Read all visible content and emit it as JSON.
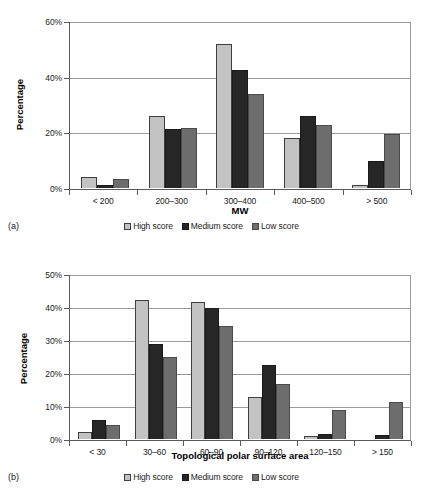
{
  "figure": {
    "panel_a_caption": "(a)",
    "panel_b_caption": "(b)"
  },
  "legend": {
    "items": [
      {
        "label": "High score",
        "color": "#c3c3c3"
      },
      {
        "label": "Medium score",
        "color": "#262626"
      },
      {
        "label": "Low score",
        "color": "#6d6d6d"
      }
    ]
  },
  "chart_data": [
    {
      "type": "bar",
      "panel": "(a)",
      "title": "",
      "xlabel": "MW",
      "ylabel": "Percentage",
      "ylim": [
        0,
        60
      ],
      "yticks": [
        0,
        20,
        40,
        60
      ],
      "ytick_labels": [
        "0%",
        "20%",
        "40%",
        "60%"
      ],
      "grid": true,
      "legend_position": "bottom",
      "categories": [
        "< 200",
        "200–300",
        "300–400",
        "400–500",
        "> 500"
      ],
      "series": [
        {
          "name": "High score",
          "color": "#c3c3c3",
          "values": [
            4.0,
            25.8,
            51.6,
            17.8,
            1.0
          ]
        },
        {
          "name": "Medium score",
          "color": "#262626",
          "values": [
            1.0,
            21.2,
            42.5,
            25.7,
            9.8
          ]
        },
        {
          "name": "Low score",
          "color": "#6d6d6d",
          "values": [
            3.1,
            21.4,
            33.8,
            22.6,
            19.3
          ]
        }
      ]
    },
    {
      "type": "bar",
      "panel": "(b)",
      "title": "",
      "xlabel": "Topological polar surface area",
      "ylabel": "Percentage",
      "ylim": [
        0,
        50
      ],
      "yticks": [
        0,
        10,
        20,
        30,
        40,
        50
      ],
      "ytick_labels": [
        "0%",
        "10%",
        "20%",
        "30%",
        "40%",
        "50%"
      ],
      "grid": true,
      "legend_position": "bottom",
      "categories": [
        "< 30",
        "30–60",
        "60–90",
        "90–120",
        "120–150",
        "> 150"
      ],
      "series": [
        {
          "name": "High score",
          "color": "#c3c3c3",
          "values": [
            2.1,
            42.1,
            41.4,
            12.7,
            0.9,
            0.0
          ]
        },
        {
          "name": "Medium score",
          "color": "#262626",
          "values": [
            5.7,
            28.8,
            39.8,
            22.4,
            1.5,
            1.3
          ]
        },
        {
          "name": "Low score",
          "color": "#6d6d6d",
          "values": [
            4.2,
            24.8,
            34.1,
            16.8,
            8.8,
            11.2
          ]
        }
      ]
    }
  ]
}
